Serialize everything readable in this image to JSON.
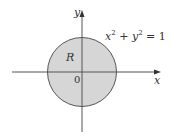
{
  "diagram": {
    "equation": {
      "x_term": "x",
      "plus": " + ",
      "y_term": "y",
      "exp": "2",
      "equals": " = 1"
    },
    "region_label": "R",
    "origin_label": "0",
    "x_axis_label": "x",
    "y_axis_label": "y",
    "colors": {
      "fill": "#d6d6d6",
      "stroke": "#555555",
      "axis": "#555555"
    }
  }
}
